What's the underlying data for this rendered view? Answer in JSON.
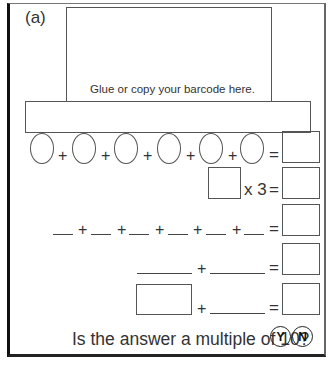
{
  "worksheet": {
    "part_label": "(a)",
    "barcode_instruction": "Glue or copy your barcode here.",
    "row1": {
      "plus": "+",
      "equals": "="
    },
    "row2": {
      "multiplier": "x 3",
      "equals": "="
    },
    "row3": {
      "plus": "+",
      "equals": "="
    },
    "row4": {
      "plus": "+",
      "equals": "="
    },
    "row5": {
      "plus": "+",
      "equals": "="
    },
    "question": "Is the answer a multiple of 10?",
    "yes_label": "Y",
    "no_label": "N"
  }
}
